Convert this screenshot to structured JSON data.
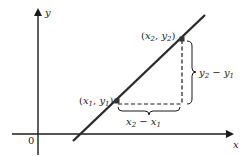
{
  "diagram": {
    "type": "slope-of-line",
    "colors": {
      "axis": "#1a1a1a",
      "line": "#2b2b2b",
      "dashed": "#1a1a1a",
      "point": "#333333",
      "background": "#ffffff"
    },
    "axes": {
      "x_label": "x",
      "y_label": "y",
      "origin_label": "0"
    },
    "points": [
      {
        "id": "p1",
        "label_open": "(",
        "var_x": "x",
        "sub_x": "1",
        "sep": ", ",
        "var_y": "y",
        "sub_y": "1",
        "label_close": ")"
      },
      {
        "id": "p2",
        "label_open": "(",
        "var_x": "x",
        "sub_x": "2",
        "sep": ", ",
        "var_y": "y",
        "sub_y": "2",
        "label_close": ")"
      }
    ],
    "rise": {
      "a": "y",
      "a_sub": "2",
      "op": " − ",
      "b": "y",
      "b_sub": "1"
    },
    "run": {
      "a": "x",
      "a_sub": "2",
      "op": " − ",
      "b": "x",
      "b_sub": "1"
    }
  }
}
